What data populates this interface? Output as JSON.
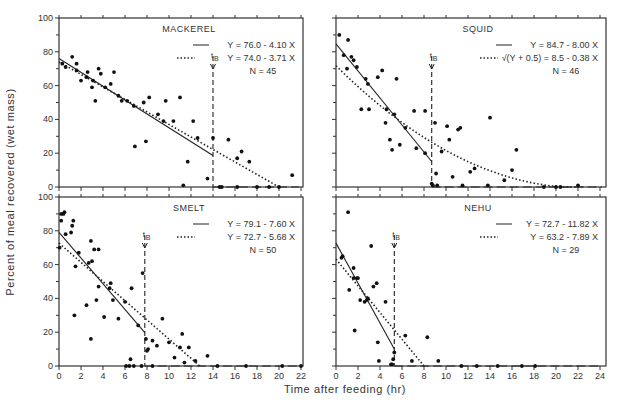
{
  "figure": {
    "y_axis_label": "Percent of meal recovered (wet mass)",
    "x_axis_label": "Time after feeding (hr)",
    "tb_label": "t",
    "tb_sub": "B"
  },
  "chart_data": [
    {
      "type": "scatter",
      "title": "MACKEREL",
      "xlabel": "Time after feeding (hr)",
      "ylabel": "Percent of meal recovered (wet mass)",
      "xlim": [
        0,
        22
      ],
      "ylim": [
        0,
        100
      ],
      "yticks": [
        0,
        20,
        40,
        60,
        80,
        100
      ],
      "xticks": [
        0,
        2,
        4,
        6,
        8,
        10,
        12,
        14,
        16,
        18,
        20,
        22
      ],
      "legend": [
        "Y = 76.0 - 4.10 X",
        "Y = 74.0 - 3.71 X",
        "N = 45"
      ],
      "tB": 14.0,
      "lines": [
        {
          "name": "Y = 76.0 - 4.10 X",
          "style": "solid",
          "x": [
            0,
            14.0
          ],
          "y": [
            76.0,
            18.6
          ]
        },
        {
          "name": "Y = 74.0 - 3.71 X",
          "style": "dotted",
          "x": [
            0,
            20.0
          ],
          "y": [
            74.0,
            0
          ]
        }
      ],
      "points": [
        [
          0.3,
          73
        ],
        [
          0.6,
          71
        ],
        [
          1.2,
          77
        ],
        [
          1.6,
          73
        ],
        [
          1.6,
          69
        ],
        [
          2.0,
          63
        ],
        [
          2.5,
          65
        ],
        [
          2.6,
          68
        ],
        [
          3.0,
          59
        ],
        [
          3.1,
          63
        ],
        [
          3.3,
          51
        ],
        [
          3.6,
          70
        ],
        [
          3.8,
          67
        ],
        [
          4.2,
          59
        ],
        [
          4.7,
          61
        ],
        [
          5.0,
          68
        ],
        [
          5.4,
          54
        ],
        [
          5.7,
          51
        ],
        [
          6.2,
          51
        ],
        [
          6.8,
          48
        ],
        [
          6.9,
          24
        ],
        [
          7.7,
          50
        ],
        [
          7.9,
          27
        ],
        [
          8.2,
          53
        ],
        [
          9.0,
          43
        ],
        [
          9.5,
          39
        ],
        [
          9.7,
          51
        ],
        [
          10.4,
          39
        ],
        [
          11.0,
          53
        ],
        [
          11.3,
          1
        ],
        [
          11.7,
          15
        ],
        [
          12.2,
          39
        ],
        [
          12.6,
          29
        ],
        [
          13.5,
          5
        ],
        [
          14.0,
          29
        ],
        [
          14.6,
          0
        ],
        [
          14.8,
          0
        ],
        [
          15.4,
          28
        ],
        [
          16.2,
          17
        ],
        [
          16.6,
          21
        ],
        [
          17.3,
          15
        ],
        [
          16.2,
          0
        ],
        [
          18.0,
          0
        ],
        [
          19.1,
          0
        ],
        [
          20.0,
          0
        ],
        [
          21.2,
          7
        ]
      ]
    },
    {
      "type": "scatter",
      "title": "SQUID",
      "xlabel": "Time after feeding (hr)",
      "ylabel": "Percent of meal recovered (wet mass)",
      "xlim": [
        0,
        24
      ],
      "ylim": [
        0,
        100
      ],
      "legend": [
        "Y = 84.7 - 8.00 X",
        "√(Y + 0.5) = 8.5 - 0.38 X",
        "N = 46"
      ],
      "tB": 8.7,
      "lines": [
        {
          "name": "Y = 84.7 - 8.00 X",
          "style": "solid"
        },
        {
          "name": "√(Y + 0.5) = 8.5 - 0.38 X",
          "style": "dotted"
        }
      ],
      "points": [
        [
          0.3,
          90
        ],
        [
          0.7,
          78
        ],
        [
          1.1,
          87
        ],
        [
          1.0,
          70
        ],
        [
          1.4,
          77
        ],
        [
          1.6,
          75
        ],
        [
          1.9,
          71
        ],
        [
          2.7,
          64
        ],
        [
          2.9,
          61
        ],
        [
          2.3,
          46
        ],
        [
          3.0,
          46
        ],
        [
          3.8,
          65
        ],
        [
          4.2,
          69
        ],
        [
          4.6,
          46
        ],
        [
          4.5,
          38
        ],
        [
          4.9,
          28
        ],
        [
          5.1,
          22
        ],
        [
          5.3,
          43
        ],
        [
          5.5,
          64
        ],
        [
          5.8,
          25
        ],
        [
          6.3,
          35
        ],
        [
          7.1,
          45
        ],
        [
          7.3,
          23
        ],
        [
          8.1,
          45
        ],
        [
          8.1,
          20
        ],
        [
          8.7,
          2
        ],
        [
          8.8,
          1
        ],
        [
          9.0,
          38
        ],
        [
          9.1,
          8
        ],
        [
          9.2,
          1
        ],
        [
          9.6,
          21
        ],
        [
          10.1,
          36
        ],
        [
          10.3,
          28
        ],
        [
          10.6,
          6
        ],
        [
          11.1,
          34
        ],
        [
          11.3,
          35
        ],
        [
          11.5,
          1
        ],
        [
          12.2,
          9
        ],
        [
          12.6,
          11
        ],
        [
          13.8,
          1
        ],
        [
          14.0,
          41
        ],
        [
          15.3,
          4
        ],
        [
          16.0,
          10
        ],
        [
          16.4,
          22
        ],
        [
          18.9,
          0
        ],
        [
          20.0,
          0
        ],
        [
          20.4,
          0
        ],
        [
          22.0,
          1
        ]
      ]
    },
    {
      "type": "scatter",
      "title": "SMELT",
      "xlabel": "Time after feeding (hr)",
      "ylabel": "Percent of meal recovered (wet mass)",
      "xlim": [
        0,
        22
      ],
      "ylim": [
        0,
        100
      ],
      "yticks": [
        0,
        20,
        40,
        60,
        80,
        100
      ],
      "xticks": [
        0,
        2,
        4,
        6,
        8,
        10,
        12,
        14,
        16,
        18,
        20,
        22
      ],
      "legend": [
        "Y = 79.1 - 7.60 X",
        "Y = 72.7 - 5.68 X",
        "N = 50"
      ],
      "tB": 7.8,
      "lines": [
        {
          "name": "Y = 79.1 - 7.60 X",
          "style": "solid",
          "x": [
            0,
            7.8
          ],
          "y": [
            79.1,
            19.8
          ]
        },
        {
          "name": "Y = 72.7 - 5.68 X",
          "style": "dotted",
          "x": [
            0,
            12.8
          ],
          "y": [
            72.7,
            0
          ]
        }
      ],
      "points": [
        [
          0.05,
          70
        ],
        [
          0.2,
          86
        ],
        [
          0.2,
          90
        ],
        [
          0.4,
          90
        ],
        [
          0.5,
          91
        ],
        [
          0.6,
          78
        ],
        [
          1.1,
          79
        ],
        [
          1.2,
          83
        ],
        [
          1.3,
          86
        ],
        [
          1.4,
          30
        ],
        [
          1.5,
          59
        ],
        [
          1.8,
          67
        ],
        [
          2.5,
          36
        ],
        [
          2.7,
          61
        ],
        [
          2.9,
          16
        ],
        [
          2.9,
          74
        ],
        [
          3.0,
          62
        ],
        [
          3.2,
          69
        ],
        [
          3.4,
          39
        ],
        [
          3.6,
          47
        ],
        [
          3.6,
          69
        ],
        [
          4.1,
          29
        ],
        [
          4.6,
          46
        ],
        [
          4.7,
          49
        ],
        [
          4.9,
          39
        ],
        [
          5.4,
          28
        ],
        [
          6.0,
          38
        ],
        [
          6.1,
          0
        ],
        [
          6.4,
          0
        ],
        [
          6.5,
          4
        ],
        [
          6.6,
          46
        ],
        [
          6.8,
          0
        ],
        [
          7.2,
          24
        ],
        [
          7.5,
          0
        ],
        [
          7.6,
          55
        ],
        [
          7.9,
          16
        ],
        [
          8.0,
          9
        ],
        [
          8.1,
          10
        ],
        [
          8.5,
          0
        ],
        [
          8.5,
          15
        ],
        [
          8.9,
          12
        ],
        [
          9.4,
          28
        ],
        [
          10.0,
          14
        ],
        [
          10.5,
          5
        ],
        [
          11.0,
          11
        ],
        [
          11.2,
          19
        ],
        [
          11.4,
          2
        ],
        [
          11.8,
          11
        ],
        [
          12.4,
          3
        ],
        [
          13.5,
          6
        ],
        [
          14.4,
          0
        ],
        [
          17.0,
          0
        ],
        [
          20.3,
          0
        ],
        [
          22.0,
          0
        ]
      ]
    },
    {
      "type": "scatter",
      "title": "NEHU",
      "xlabel": "Time after feeding (hr)",
      "ylabel": "Percent of meal recovered (wet mass)",
      "xlim": [
        0,
        24
      ],
      "ylim": [
        0,
        100
      ],
      "xticks": [
        0,
        2,
        4,
        6,
        8,
        10,
        12,
        14,
        16,
        18,
        20,
        22,
        24
      ],
      "legend": [
        "Y = 72.7 - 11.82 X",
        "Y = 63.2 - 7.89 X",
        "N = 29"
      ],
      "tB": 5.3,
      "lines": [
        {
          "name": "Y = 72.7 - 11.82 X",
          "style": "solid",
          "x": [
            0,
            5.3
          ],
          "y": [
            72.7,
            10.0
          ]
        },
        {
          "name": "Y = 63.2 - 7.89 X",
          "style": "dotted",
          "x": [
            0,
            8.0
          ],
          "y": [
            63.2,
            0
          ]
        }
      ],
      "points": [
        [
          0.5,
          64
        ],
        [
          0.6,
          65
        ],
        [
          1.1,
          91
        ],
        [
          1.2,
          45
        ],
        [
          1.6,
          58
        ],
        [
          1.6,
          52
        ],
        [
          1.7,
          21
        ],
        [
          1.9,
          52
        ],
        [
          2.0,
          52
        ],
        [
          2.2,
          39
        ],
        [
          2.6,
          38
        ],
        [
          2.8,
          39
        ],
        [
          2.9,
          40
        ],
        [
          3.2,
          71
        ],
        [
          3.4,
          47
        ],
        [
          3.7,
          49
        ],
        [
          3.8,
          14
        ],
        [
          3.9,
          3
        ],
        [
          4.5,
          38
        ],
        [
          5.0,
          1
        ],
        [
          5.1,
          1
        ],
        [
          5.2,
          4
        ],
        [
          5.3,
          8
        ],
        [
          6.3,
          18
        ],
        [
          6.9,
          3
        ],
        [
          8.3,
          17
        ],
        [
          9.3,
          3
        ],
        [
          11.4,
          0
        ],
        [
          12.8,
          0
        ],
        [
          14.7,
          0
        ],
        [
          16.9,
          0
        ],
        [
          18.1,
          0
        ]
      ]
    }
  ]
}
